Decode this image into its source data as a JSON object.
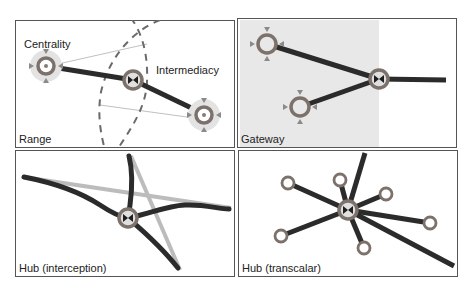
{
  "colors": {
    "panel_border": "#555555",
    "edge_dark": "#2b2b2b",
    "edge_light": "#bcbcbc",
    "node_ring": "#7d716c",
    "halo": "#e3e3e3",
    "shade": "#e8e8e8",
    "dash": "#6a6a6a",
    "thin_line": "#b0b0b0",
    "marker": "#8a8a8a"
  },
  "panels": [
    {
      "id": "range",
      "label": "Range",
      "annotations": [
        "Centrality",
        "Intermediacy"
      ]
    },
    {
      "id": "gateway",
      "label": "Gateway"
    },
    {
      "id": "hub-interception",
      "label": "Hub (interception)"
    },
    {
      "id": "hub-transcalar",
      "label": "Hub (transcalar)"
    }
  ]
}
